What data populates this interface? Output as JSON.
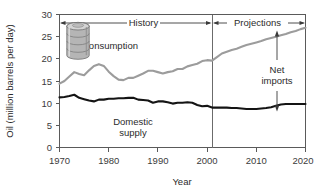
{
  "chart_data": {
    "type": "line",
    "title": "",
    "xlabel": "Year",
    "ylabel": "Oil (million barrels per day)",
    "xlim": [
      1970,
      2020
    ],
    "ylim": [
      0,
      30
    ],
    "ytick_step": 5,
    "xtick_step": 10,
    "xticks": [
      "1970",
      "1980",
      "1990",
      "2000",
      "2010",
      "2020"
    ],
    "yticks": [
      "0",
      "5",
      "10",
      "15",
      "20",
      "25",
      "30"
    ],
    "grid": false,
    "legend_position": "inline-labels",
    "colors": {
      "consumption": "#9c9c9c",
      "domestic_supply": "#141414",
      "axis": "#5a5a5a",
      "text": "#2b2b2b",
      "divider": "#6b6b6b"
    },
    "divider_year": 2001,
    "series": [
      {
        "name": "Consumption",
        "color": "#9c9c9c",
        "x": [
          1970,
          1971,
          1972,
          1973,
          1974,
          1975,
          1976,
          1977,
          1978,
          1979,
          1980,
          1981,
          1982,
          1983,
          1984,
          1985,
          1986,
          1987,
          1988,
          1989,
          1990,
          1991,
          1992,
          1993,
          1994,
          1995,
          1996,
          1997,
          1998,
          1999,
          2000,
          2001,
          2002,
          2003,
          2004,
          2005,
          2006,
          2007,
          2008,
          2009,
          2010,
          2011,
          2012,
          2013,
          2014,
          2015,
          2016,
          2017,
          2018,
          2019,
          2020
        ],
        "values": [
          14.4,
          15.0,
          16.0,
          17.0,
          16.6,
          16.3,
          17.4,
          18.4,
          18.8,
          18.4,
          17.1,
          16.1,
          15.3,
          15.2,
          15.7,
          15.7,
          16.2,
          16.7,
          17.3,
          17.3,
          17.0,
          16.7,
          17.0,
          17.2,
          17.7,
          17.7,
          18.3,
          18.6,
          18.9,
          19.5,
          19.7,
          19.6,
          20.4,
          21.2,
          21.6,
          22.0,
          22.3,
          22.7,
          23.1,
          23.4,
          23.7,
          24.0,
          24.4,
          24.7,
          25.0,
          25.3,
          25.6,
          26.0,
          26.3,
          26.7,
          27.0
        ]
      },
      {
        "name": "Domestic supply",
        "color": "#141414",
        "x": [
          1970,
          1971,
          1972,
          1973,
          1974,
          1975,
          1976,
          1977,
          1978,
          1979,
          1980,
          1981,
          1982,
          1983,
          1984,
          1985,
          1986,
          1987,
          1988,
          1989,
          1990,
          1991,
          1992,
          1993,
          1994,
          1995,
          1996,
          1997,
          1998,
          1999,
          2000,
          2001,
          2002,
          2003,
          2004,
          2005,
          2006,
          2007,
          2008,
          2009,
          2010,
          2011,
          2012,
          2013,
          2014,
          2015,
          2016,
          2017,
          2018,
          2019,
          2020
        ],
        "values": [
          11.3,
          11.4,
          11.6,
          11.9,
          11.2,
          10.9,
          10.6,
          10.4,
          10.8,
          10.8,
          11.0,
          11.0,
          11.1,
          11.1,
          11.2,
          11.2,
          10.8,
          10.7,
          10.6,
          10.1,
          10.4,
          10.4,
          10.2,
          9.9,
          10.1,
          10.1,
          10.2,
          10.1,
          9.6,
          9.3,
          9.4,
          9.0,
          9.0,
          9.0,
          9.0,
          8.9,
          8.9,
          8.8,
          8.7,
          8.7,
          8.7,
          8.8,
          8.9,
          9.1,
          9.4,
          9.7,
          9.8,
          9.8,
          9.8,
          9.8,
          9.8
        ]
      }
    ],
    "annotations": [
      {
        "id": "history",
        "label": "History",
        "type": "horizontal-double-arrow",
        "from_year": 1970,
        "to_year": 2001,
        "at_value": 28.0
      },
      {
        "id": "projections",
        "label": "Projections",
        "type": "horizontal-double-arrow",
        "from_year": 2001,
        "to_year": 2020,
        "at_value": 28.0
      },
      {
        "id": "net-imports",
        "label_line1": "Net",
        "label_line2": "imports",
        "type": "vertical-double-arrow",
        "at_year": 2016,
        "from_value": 9.6,
        "to_value": 25.8
      },
      {
        "id": "consumption-label",
        "label": "Consumption",
        "type": "series-label"
      },
      {
        "id": "domestic-label-line1",
        "label": "Domestic",
        "type": "series-label"
      },
      {
        "id": "domestic-label-line2",
        "label": "supply",
        "type": "series-label"
      },
      {
        "id": "oil-barrel",
        "label": "oil-barrel-icon",
        "type": "decorative-icon"
      }
    ]
  }
}
